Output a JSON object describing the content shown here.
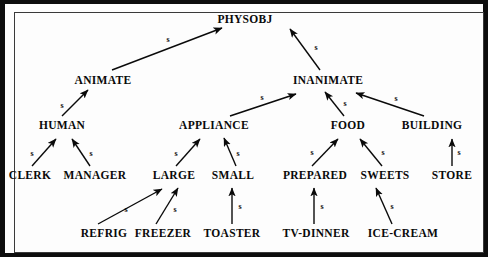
{
  "figure": {
    "kind": "is-a-hierarchy-diagram",
    "relation_label": "s",
    "frame_color": "#0d0d0d",
    "background_color": "#fdfdfd",
    "ink_color": "#0a0a0a"
  },
  "nodes": [
    {
      "id": "physobj",
      "label": "PHYSOBJ",
      "x": 245,
      "y": 20,
      "level": 0
    },
    {
      "id": "animate",
      "label": "ANIMATE",
      "x": 103,
      "y": 81,
      "level": 1
    },
    {
      "id": "inanimate",
      "label": "INANIMATE",
      "x": 328,
      "y": 81,
      "level": 1
    },
    {
      "id": "human",
      "label": "HUMAN",
      "x": 62,
      "y": 126,
      "level": 2
    },
    {
      "id": "appliance",
      "label": "APPLIANCE",
      "x": 214,
      "y": 126,
      "level": 2
    },
    {
      "id": "food",
      "label": "FOOD",
      "x": 348,
      "y": 126,
      "level": 2
    },
    {
      "id": "building",
      "label": "BUILDING",
      "x": 432,
      "y": 126,
      "level": 2
    },
    {
      "id": "clerk",
      "label": "CLERK",
      "x": 30,
      "y": 176,
      "level": 3
    },
    {
      "id": "manager",
      "label": "MANAGER",
      "x": 95,
      "y": 176,
      "level": 3
    },
    {
      "id": "large",
      "label": "LARGE",
      "x": 174,
      "y": 176,
      "level": 3
    },
    {
      "id": "small",
      "label": "SMALL",
      "x": 233,
      "y": 176,
      "level": 3
    },
    {
      "id": "prepared",
      "label": "PREPARED",
      "x": 315,
      "y": 176,
      "level": 3
    },
    {
      "id": "sweets",
      "label": "SWEETS",
      "x": 385,
      "y": 176,
      "level": 3
    },
    {
      "id": "store",
      "label": "STORE",
      "x": 452,
      "y": 176,
      "level": 3
    },
    {
      "id": "refrig",
      "label": "REFRIG",
      "x": 104,
      "y": 234,
      "level": 4
    },
    {
      "id": "freezer",
      "label": "FREEZER",
      "x": 163,
      "y": 234,
      "level": 4
    },
    {
      "id": "toaster",
      "label": "TOASTER",
      "x": 232,
      "y": 234,
      "level": 4
    },
    {
      "id": "tvdinner",
      "label": "TV-DINNER",
      "x": 316,
      "y": 234,
      "level": 4
    },
    {
      "id": "icecream",
      "label": "ICE-CREAM",
      "x": 403,
      "y": 234,
      "level": 4
    }
  ],
  "edges": [
    {
      "id": "animate-physobj",
      "from": "animate",
      "to": "physobj",
      "label": "s",
      "x1": 112,
      "y1": 70,
      "x2": 222,
      "y2": 28,
      "lx": 168,
      "ly": 40
    },
    {
      "id": "inanimate-physobj",
      "from": "inanimate",
      "to": "physobj",
      "label": "s",
      "x1": 320,
      "y1": 70,
      "x2": 290,
      "y2": 29,
      "lx": 316,
      "ly": 48
    },
    {
      "id": "human-animate",
      "from": "human",
      "to": "animate",
      "label": "s",
      "x1": 62,
      "y1": 116,
      "x2": 88,
      "y2": 90,
      "lx": 62,
      "ly": 106
    },
    {
      "id": "appliance-inanimate",
      "from": "appliance",
      "to": "inanimate",
      "label": "s",
      "x1": 230,
      "y1": 116,
      "x2": 296,
      "y2": 94,
      "lx": 262,
      "ly": 98
    },
    {
      "id": "food-inanimate",
      "from": "food",
      "to": "inanimate",
      "label": "s",
      "x1": 344,
      "y1": 116,
      "x2": 325,
      "y2": 92,
      "lx": 345,
      "ly": 104
    },
    {
      "id": "building-inanimate",
      "from": "building",
      "to": "inanimate",
      "label": "s",
      "x1": 424,
      "y1": 116,
      "x2": 356,
      "y2": 93,
      "lx": 396,
      "ly": 99
    },
    {
      "id": "clerk-human",
      "from": "clerk",
      "to": "human",
      "label": "s",
      "x1": 32,
      "y1": 166,
      "x2": 56,
      "y2": 139,
      "lx": 32,
      "ly": 154
    },
    {
      "id": "manager-human",
      "from": "manager",
      "to": "human",
      "label": "s",
      "x1": 90,
      "y1": 166,
      "x2": 72,
      "y2": 139,
      "lx": 91,
      "ly": 154
    },
    {
      "id": "large-appliance",
      "from": "large",
      "to": "appliance",
      "label": "s",
      "x1": 176,
      "y1": 166,
      "x2": 200,
      "y2": 139,
      "lx": 176,
      "ly": 154
    },
    {
      "id": "small-appliance",
      "from": "small",
      "to": "appliance",
      "label": "s",
      "x1": 236,
      "y1": 166,
      "x2": 224,
      "y2": 138,
      "lx": 238,
      "ly": 154
    },
    {
      "id": "prepared-food",
      "from": "prepared",
      "to": "food",
      "label": "s",
      "x1": 312,
      "y1": 166,
      "x2": 338,
      "y2": 139,
      "lx": 312,
      "ly": 153
    },
    {
      "id": "sweets-food",
      "from": "sweets",
      "to": "food",
      "label": "s",
      "x1": 382,
      "y1": 166,
      "x2": 360,
      "y2": 139,
      "lx": 383,
      "ly": 153
    },
    {
      "id": "store-building",
      "from": "store",
      "to": "building",
      "label": "s",
      "x1": 452,
      "y1": 166,
      "x2": 452,
      "y2": 139,
      "lx": 459,
      "ly": 153
    },
    {
      "id": "refrig-large",
      "from": "refrig",
      "to": "large",
      "label": "s",
      "x1": 98,
      "y1": 224,
      "x2": 162,
      "y2": 189,
      "lx": 126,
      "ly": 210
    },
    {
      "id": "freezer-large",
      "from": "freezer",
      "to": "large",
      "label": "s",
      "x1": 156,
      "y1": 224,
      "x2": 178,
      "y2": 188,
      "lx": 175,
      "ly": 210
    },
    {
      "id": "toaster-small",
      "from": "toaster",
      "to": "small",
      "label": "s",
      "x1": 232,
      "y1": 224,
      "x2": 232,
      "y2": 188,
      "lx": 240,
      "ly": 207
    },
    {
      "id": "tvdinner-prepared",
      "from": "tvdinner",
      "to": "prepared",
      "label": "s",
      "x1": 314,
      "y1": 224,
      "x2": 314,
      "y2": 188,
      "lx": 322,
      "ly": 207
    },
    {
      "id": "icecream-sweets",
      "from": "icecream",
      "to": "sweets",
      "label": "s",
      "x1": 392,
      "y1": 224,
      "x2": 376,
      "y2": 188,
      "lx": 392,
      "ly": 207
    }
  ]
}
